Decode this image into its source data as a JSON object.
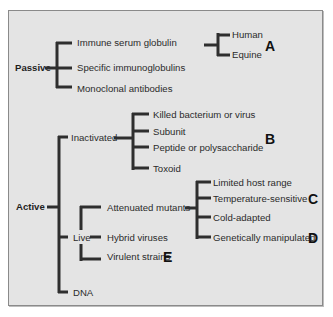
{
  "diagram": {
    "title": "",
    "root_categories": [
      {
        "label": "Passive",
        "children": [
          {
            "label": "Immune serum globulin",
            "children": [
              {
                "label": "Human"
              },
              {
                "label": "Equine"
              }
            ],
            "marker": "A"
          },
          {
            "label": "Specific immunoglobulins"
          },
          {
            "label": "Monoclonal antibodies"
          }
        ]
      },
      {
        "label": "Active",
        "children": [
          {
            "label": "Inactivated",
            "marker": "B",
            "children": [
              {
                "label": "Killed bacterium or virus"
              },
              {
                "label": "Subunit"
              },
              {
                "label": "Peptide or polysaccharide"
              },
              {
                "label": "Toxoid"
              }
            ]
          },
          {
            "label": "Live",
            "children": [
              {
                "label": "Attenuated mutants",
                "children": [
                  {
                    "label": "Limited host range"
                  },
                  {
                    "label": "Temperature-sensitive",
                    "marker": "C"
                  },
                  {
                    "label": "Cold-adapted"
                  },
                  {
                    "label": "Genetically manipulated",
                    "marker": "D"
                  }
                ]
              },
              {
                "label": "Hybrid viruses"
              },
              {
                "label": "Virulent strains",
                "marker": "E"
              }
            ]
          },
          {
            "label": "DNA"
          }
        ]
      }
    ],
    "markers": {
      "A": "A",
      "B": "B",
      "C": "C",
      "D": "D",
      "E": "E"
    },
    "colors": {
      "panel_bg": "#e4e4e4",
      "line": "#2e2e2e",
      "text": "#2b2b2b",
      "border": "#8a8a8a"
    }
  }
}
